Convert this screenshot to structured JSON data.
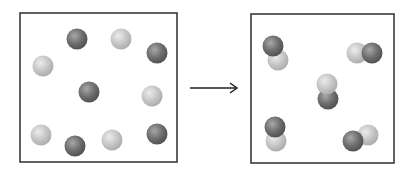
{
  "diagram": {
    "type": "reaction-particle-diagram",
    "colors": {
      "box_border": "#3a3a3a",
      "dark_atom": "#6a6a6a",
      "dark_atom_highlight": "#a8a8a8",
      "light_atom": "#c4c4c4",
      "light_atom_highlight": "#ececec",
      "arrow": "#222222"
    },
    "atom_radius": 10.5,
    "reactants_box": {
      "x": 20,
      "y": 13,
      "width": 157,
      "height": 149,
      "atoms": [
        {
          "type": "dark",
          "cx": 77,
          "cy": 39
        },
        {
          "type": "light",
          "cx": 121,
          "cy": 39
        },
        {
          "type": "dark",
          "cx": 157,
          "cy": 53
        },
        {
          "type": "light",
          "cx": 43,
          "cy": 66
        },
        {
          "type": "dark",
          "cx": 89,
          "cy": 92
        },
        {
          "type": "light",
          "cx": 152,
          "cy": 96
        },
        {
          "type": "light",
          "cx": 41,
          "cy": 135
        },
        {
          "type": "dark",
          "cx": 75,
          "cy": 146
        },
        {
          "type": "light",
          "cx": 112,
          "cy": 140
        },
        {
          "type": "dark",
          "cx": 157,
          "cy": 134
        }
      ]
    },
    "arrow": {
      "x1": 190,
      "y1": 88,
      "x2": 237,
      "y2": 88
    },
    "products_box": {
      "x": 251,
      "y": 14,
      "width": 143,
      "height": 149,
      "molecules": [
        {
          "atoms": [
            {
              "type": "light",
              "cx": 278,
              "cy": 60
            },
            {
              "type": "dark",
              "cx": 273,
              "cy": 46
            }
          ]
        },
        {
          "atoms": [
            {
              "type": "light",
              "cx": 357,
              "cy": 53
            },
            {
              "type": "dark",
              "cx": 372,
              "cy": 53
            }
          ]
        },
        {
          "atoms": [
            {
              "type": "dark",
              "cx": 328,
              "cy": 99
            },
            {
              "type": "light",
              "cx": 327,
              "cy": 84
            }
          ]
        },
        {
          "atoms": [
            {
              "type": "light",
              "cx": 276,
              "cy": 141
            },
            {
              "type": "dark",
              "cx": 275,
              "cy": 127
            }
          ]
        },
        {
          "atoms": [
            {
              "type": "light",
              "cx": 368,
              "cy": 135
            },
            {
              "type": "dark",
              "cx": 353,
              "cy": 141
            }
          ]
        }
      ]
    }
  }
}
